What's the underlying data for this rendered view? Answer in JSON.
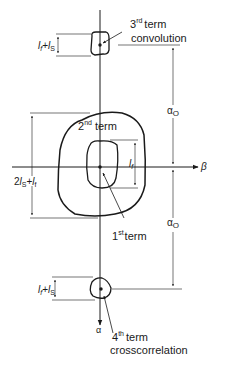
{
  "diagram": {
    "axes": {
      "horizontal_label": "β",
      "vertical_label": "α"
    },
    "terms": {
      "third": {
        "ordinal": "3",
        "sup": "rd",
        "word": "term",
        "description": "convolution",
        "size_label_a": "l",
        "size_label_a_sub": "f",
        "plus": "+",
        "size_label_b": "l",
        "size_label_b_sub": "S"
      },
      "second": {
        "ordinal": "2",
        "sup": "nd",
        "word": "term",
        "size_label_pre": "2",
        "size_label_a": "l",
        "size_label_a_sub": "S",
        "plus": "+",
        "size_label_b": "l",
        "size_label_b_sub": "f"
      },
      "first": {
        "ordinal": "1",
        "sup": "st",
        "word": "term",
        "size_label": "l",
        "size_label_sub": "f"
      },
      "fourth": {
        "ordinal": "4",
        "sup": "th",
        "word": "term",
        "description": "crosscorrelation",
        "size_label_a": "l",
        "size_label_a_sub": "f",
        "plus": "+",
        "size_label_b": "l",
        "size_label_b_sub": "S"
      }
    },
    "offsets": {
      "upper": {
        "symbol": "α",
        "sub": "O"
      },
      "lower": {
        "symbol": "α",
        "sub": "O"
      }
    },
    "colors": {
      "ink": "#1a1a1a",
      "background": "#ffffff"
    }
  }
}
